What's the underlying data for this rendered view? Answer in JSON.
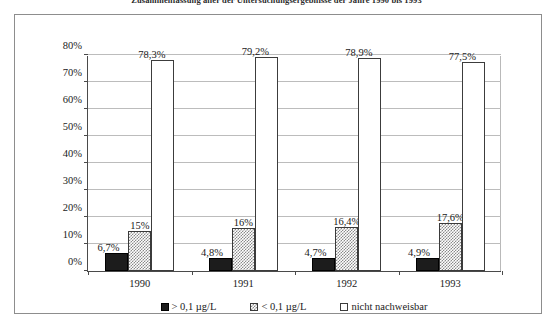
{
  "title": "Zusammenfassung aller der Untersuchungsergebnisse der Jahre 1990 bis 1993",
  "chart_data": {
    "type": "bar",
    "title": "Zusammenfassung aller der Untersuchungsergebnisse der Jahre 1990 bis 1993",
    "xlabel": "",
    "ylabel": "",
    "categories": [
      "1990",
      "1991",
      "1992",
      "1993"
    ],
    "series": [
      {
        "name": "> 0,1 µg/L",
        "style": "solid-black",
        "values": [
          6.7,
          4.8,
          4.7,
          4.9
        ],
        "labels": [
          "6,7%",
          "4,8%",
          "4,7%",
          "4,9%"
        ]
      },
      {
        "name": "< 0,1 µg/L",
        "style": "checkered-gray",
        "values": [
          15.0,
          16.0,
          16.4,
          17.6
        ],
        "labels": [
          "15%",
          "16%",
          "16,4%",
          "17,6%"
        ]
      },
      {
        "name": "nicht nachweisbar",
        "style": "white-outline",
        "values": [
          78.3,
          79.2,
          78.9,
          77.5
        ],
        "labels": [
          "78,3%",
          "79,2%",
          "78,9%",
          "77,5%"
        ]
      }
    ],
    "ylim": [
      0,
      80
    ],
    "yticks": [
      0,
      10,
      20,
      30,
      40,
      50,
      60,
      70,
      80
    ],
    "ytick_labels": [
      "0%",
      "10%",
      "20%",
      "30%",
      "40%",
      "50%",
      "60%",
      "70%",
      "80%"
    ],
    "grid": true,
    "legend_position": "bottom",
    "colors": {
      "series_1": "#1c1c1c",
      "series_2": "#8a8a8a",
      "series_3": "#ffffff",
      "axis": "#4a4a4a",
      "gridline": "#bcbcbc",
      "frame": "#8d8d8d",
      "background": "#ffffff"
    }
  },
  "legend": {
    "items": [
      {
        "label": "> 0,1 µg/L"
      },
      {
        "label": "< 0,1 µg/L"
      },
      {
        "label": "nicht nachweisbar"
      }
    ]
  }
}
